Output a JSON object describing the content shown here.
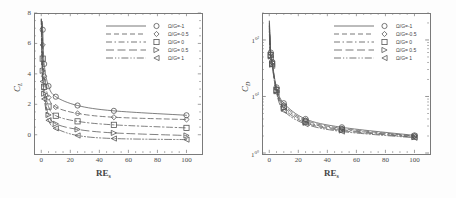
{
  "figure": {
    "panels": [
      {
        "id": "lift",
        "ylabel_main": "C",
        "ylabel_sub": "L",
        "xlabel_main": "RE",
        "xlabel_sub": "s"
      },
      {
        "id": "drag",
        "ylabel_main": "C",
        "ylabel_sub": "D",
        "xlabel_main": "RE",
        "xlabel_sub": "s"
      }
    ]
  },
  "chart_data": [
    {
      "type": "line",
      "id": "lift-coefficient",
      "title": "",
      "xlabel": "RE_s",
      "ylabel": "C_L",
      "xlim": [
        -5,
        110
      ],
      "ylim": [
        -1.2,
        8
      ],
      "yscale": "linear",
      "xticks": [
        0,
        20,
        40,
        60,
        80,
        100
      ],
      "yticks": [
        0,
        2,
        4,
        6,
        8
      ],
      "xticklabels": [
        "0",
        "20",
        "40",
        "60",
        "80",
        "100"
      ],
      "yticklabels": [
        "0",
        "2",
        "4",
        "6",
        "8"
      ],
      "grid": false,
      "legend_position": "upper-right",
      "x": [
        1,
        2,
        5,
        10,
        25,
        50,
        100
      ],
      "series": [
        {
          "name": "Ω/G=-1",
          "marker": "circle",
          "dash": "solid",
          "values": [
            6.9,
            4.65,
            3.2,
            2.5,
            1.92,
            1.57,
            1.28
          ]
        },
        {
          "name": "Ω/G=-0.5",
          "marker": "diamond",
          "dash": "dashed",
          "values": [
            5.9,
            3.85,
            2.45,
            1.82,
            1.4,
            1.15,
            1.0
          ]
        },
        {
          "name": "Ω/G= 0",
          "marker": "square",
          "dash": "dash-dot",
          "values": [
            5.0,
            3.15,
            1.85,
            1.25,
            0.88,
            0.65,
            0.45
          ]
        },
        {
          "name": "Ω/G= 0.5",
          "marker": "triangle-right",
          "dash": "long-dash",
          "values": [
            4.2,
            2.7,
            1.3,
            0.72,
            0.35,
            0.12,
            -0.05
          ]
        },
        {
          "name": "Ω/G= 1",
          "marker": "triangle-left",
          "dash": "dash-dot-dot",
          "values": [
            3.5,
            2.35,
            0.95,
            0.42,
            -0.05,
            -0.25,
            -0.32
          ]
        }
      ]
    },
    {
      "type": "line",
      "id": "drag-coefficient",
      "title": "",
      "xlabel": "RE_s",
      "ylabel": "C_D",
      "xlim": [
        -5,
        110
      ],
      "ylim": [
        1,
        300
      ],
      "yscale": "log",
      "xticks": [
        0,
        20,
        40,
        60,
        80,
        100
      ],
      "yticks": [
        1,
        10,
        100
      ],
      "xticklabels": [
        "0",
        "20",
        "40",
        "60",
        "80",
        "100"
      ],
      "yticklabels": [
        "10⁰",
        "10¹",
        "10²"
      ],
      "grid": false,
      "legend_position": "upper-right",
      "x": [
        1,
        2,
        5,
        10,
        25,
        50,
        100
      ],
      "series": [
        {
          "name": "Ω/G=-1",
          "marker": "circle",
          "dash": "solid",
          "values": [
            60,
            41,
            14.5,
            7.6,
            4.0,
            2.85,
            2.05
          ]
        },
        {
          "name": "Ω/G=-0.5",
          "marker": "diamond",
          "dash": "dashed",
          "values": [
            57,
            39.5,
            13.8,
            7.1,
            3.8,
            2.72,
            2.0
          ]
        },
        {
          "name": "Ω/G= 0",
          "marker": "square",
          "dash": "dash-dot",
          "values": [
            54,
            38,
            13.0,
            6.6,
            3.6,
            2.6,
            1.95
          ]
        },
        {
          "name": "Ω/G= 0.5",
          "marker": "triangle-right",
          "dash": "long-dash",
          "values": [
            51,
            36.5,
            12.3,
            6.1,
            3.42,
            2.5,
            1.9
          ]
        },
        {
          "name": "Ω/G= 1",
          "marker": "triangle-left",
          "dash": "dash-dot-dot",
          "values": [
            48,
            35,
            11.6,
            5.6,
            3.25,
            2.4,
            1.86
          ]
        }
      ]
    }
  ],
  "colors": {
    "line": "#555555",
    "axis": "#7a7a7a",
    "text": "#3f3f3f",
    "background": "#ffffff"
  }
}
